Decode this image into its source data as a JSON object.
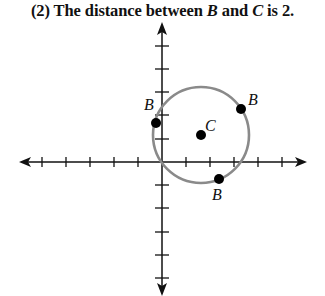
{
  "title": {
    "prefix": "(2) The distance between ",
    "var1": "B",
    "middle": " and ",
    "var2": "C",
    "suffix": " is 2."
  },
  "diagram": {
    "type": "coordinate-plane",
    "axes": {
      "x_ticks_left": 5,
      "x_ticks_right": 5,
      "y_ticks_up": 5,
      "y_ticks_down": 5,
      "arrows": true
    },
    "circle": {
      "center_label": "C",
      "center": [
        1.6,
        1.1
      ],
      "radius": 2,
      "stroke": "#8a8a8a"
    },
    "points": [
      {
        "label": "C",
        "x": 1.6,
        "y": 1.1
      },
      {
        "label": "B",
        "x": -0.25,
        "y": 1.6
      },
      {
        "label": "B",
        "x": 3.3,
        "y": 2.2
      },
      {
        "label": "B",
        "x": 2.4,
        "y": -0.7
      }
    ],
    "point_color": "#000000"
  }
}
